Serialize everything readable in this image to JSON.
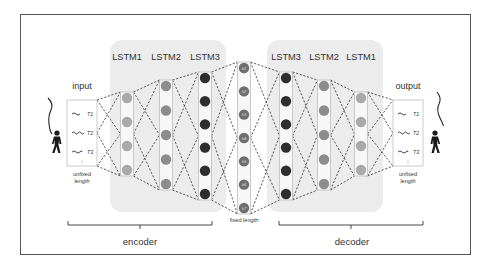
{
  "diagram": {
    "type": "seq2seq-lstm-autoencoder",
    "input_label": "input",
    "output_label": "output",
    "input_length_label": "unfixed length",
    "output_length_label": "unfixed length",
    "input_length_lines": [
      "unfixed",
      "length"
    ],
    "output_length_lines": [
      "unfixed",
      "length"
    ],
    "fixed_length_label": "fixed length",
    "encoder_label": "encoder",
    "decoder_label": "decoder",
    "input_steps": [
      "T1",
      "T2",
      "T3"
    ],
    "output_steps": [
      "T1",
      "T2",
      "T3"
    ],
    "encoder_layers": [
      {
        "label": "LSTM1",
        "units": 4,
        "color": "#a9a9a9"
      },
      {
        "label": "LSTM2",
        "units": 5,
        "color": "#8c8c8c"
      },
      {
        "label": "LSTM3",
        "units": 6,
        "color": "#2e2e2e"
      }
    ],
    "latent": {
      "units": 7,
      "color": "#6e6e6e",
      "unit_labels": [
        "h1",
        "h2",
        "h3",
        "h4",
        "h5",
        "h6",
        "h7"
      ]
    },
    "decoder_layers": [
      {
        "label": "LSTM3",
        "units": 6,
        "color": "#2e2e2e"
      },
      {
        "label": "LSTM2",
        "units": 5,
        "color": "#8c8c8c"
      },
      {
        "label": "LSTM1",
        "units": 4,
        "color": "#a9a9a9"
      }
    ],
    "colors": {
      "frame": "#555555",
      "panel": "#ececec",
      "column_border": "#bdbdbd",
      "dash": "#333333",
      "person": "#1a1a1a"
    }
  }
}
